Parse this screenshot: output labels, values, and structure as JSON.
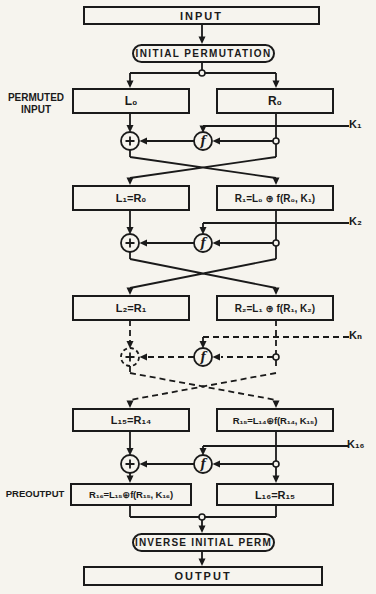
{
  "nodes": {
    "input": "INPUT",
    "initial_permutation": "INITIAL PERMUTATION",
    "inverse_initial_perm": "INVERSE INITIAL PERM",
    "output": "OUTPUT"
  },
  "side_labels": {
    "permuted_input_line1": "PERMUTED",
    "permuted_input_line2": "INPUT",
    "preoutput": "PREOUTPUT"
  },
  "keys": {
    "k1": "K₁",
    "k2": "K₂",
    "kn": "Kₙ",
    "k16": "K₁₆"
  },
  "registers": {
    "l0": "L₀",
    "r0": "R₀",
    "l1": "L₁=R₀",
    "r1": "R₁=L₀ ⊕ f(R₀, K₁)",
    "l2": "L₂=R₁",
    "r2": "R₂=L₁ ⊕ f(R₁, K₂)",
    "l15": "L₁₅=R₁₄",
    "r15": "R₁₅=L₁₄⊕f(R₁₄, K₁₅)",
    "r16": "R₁₆=L₁₅⊕f(R₁₅, K₁₆)",
    "l16": "L₁₆=R₁₅"
  },
  "operators": {
    "xor_icon": "+",
    "f_function": "f"
  },
  "colors": {
    "ink": "#1a1a1a",
    "paper": "#f6f4ee"
  }
}
